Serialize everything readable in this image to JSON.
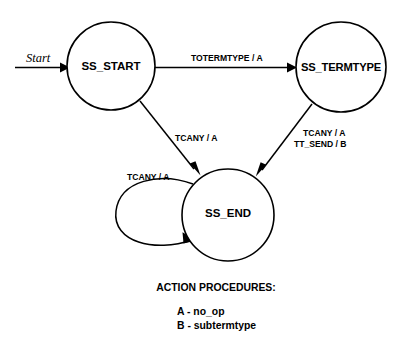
{
  "diagram": {
    "colors": {
      "background": "#ffffff",
      "stroke": "#000000",
      "text": "#000000"
    },
    "start_marker": {
      "label": "Start"
    },
    "states": [
      {
        "id": "ss_start",
        "label": "SS_START",
        "cx": 111,
        "cy": 66,
        "r": 44
      },
      {
        "id": "ss_termtype",
        "label": "SS_TERMTYPE",
        "cx": 341,
        "cy": 67,
        "r": 45
      },
      {
        "id": "ss_end",
        "label": "SS_END",
        "cx": 228,
        "cy": 215,
        "r": 46
      }
    ],
    "transitions": [
      {
        "id": "start-to-ss_start",
        "from": "",
        "to": "SS_START",
        "label": "Start",
        "kind": "initial"
      },
      {
        "id": "ss_start-to-ss_termtype",
        "from": "SS_START",
        "to": "SS_TERMTYPE",
        "label": "TOTERMTYPE / A",
        "kind": "straight"
      },
      {
        "id": "ss_start-to-ss_end",
        "from": "SS_START",
        "to": "SS_END",
        "label": "TCANY / A",
        "kind": "straight"
      },
      {
        "id": "ss_termtype-to-ss_end",
        "from": "SS_TERMTYPE",
        "to": "SS_END",
        "label_line1": "TCANY / A",
        "label_line2": "TT_SEND / B",
        "kind": "straight"
      },
      {
        "id": "ss_end-self-loop",
        "from": "SS_END",
        "to": "SS_END",
        "label": "TCANY / A",
        "kind": "self-loop"
      }
    ]
  },
  "legend": {
    "title": "ACTION PROCEDURES:",
    "entries": [
      {
        "code": "A",
        "text": "A - no_op"
      },
      {
        "code": "B",
        "text": "B - subtermtype"
      }
    ]
  }
}
